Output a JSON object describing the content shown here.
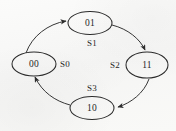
{
  "figure": {
    "type": "state-transition-diagram",
    "title": "",
    "background_color": "#f9f9f8",
    "ink_color": "#262626"
  },
  "states": [
    {
      "id": "s_01",
      "label": "01",
      "cx": 90,
      "cy": 23,
      "rx": 22,
      "ry": 11.5,
      "position": "top"
    },
    {
      "id": "s_00",
      "label": "00",
      "cx": 34,
      "cy": 64,
      "rx": 22,
      "ry": 12,
      "position": "left"
    },
    {
      "id": "s_11",
      "label": "11",
      "cx": 147,
      "cy": 65,
      "rx": 21,
      "ry": 13,
      "position": "right"
    },
    {
      "id": "s_10",
      "label": "10",
      "cx": 92,
      "cy": 108,
      "rx": 22,
      "ry": 11.5,
      "position": "bottom"
    }
  ],
  "transitions": [
    {
      "id": "t_s0",
      "label": "S0",
      "from": "00",
      "to": "01",
      "label_x": 57,
      "label_y": 60,
      "arc": "left-top"
    },
    {
      "id": "t_s1",
      "label": "S1",
      "from": "01",
      "to": "11",
      "label_x": 84,
      "label_y": 39,
      "arc": "top-right"
    },
    {
      "id": "t_s2",
      "label": "S2",
      "from": "11",
      "to": "10",
      "label_x": 107,
      "label_y": 61,
      "arc": "right-bottom"
    },
    {
      "id": "t_s3",
      "label": "S3",
      "from": "10",
      "to": "00",
      "label_x": 84,
      "label_y": 84,
      "arc": "bottom-left"
    }
  ]
}
